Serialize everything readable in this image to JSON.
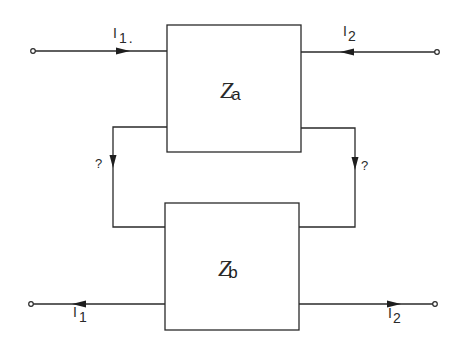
{
  "diagram": {
    "type": "two-port network interconnection",
    "blocks": {
      "top": {
        "symbol": "Z",
        "subscript": "a"
      },
      "bottom": {
        "symbol": "Z",
        "subscript": "b"
      }
    },
    "currents": {
      "top_left": {
        "symbol": "I",
        "subscript": "1",
        "trailing": ".",
        "direction": "right"
      },
      "top_right": {
        "symbol": "I",
        "subscript": "2",
        "direction": "left"
      },
      "bottom_left": {
        "symbol": "I",
        "subscript": "1",
        "direction": "left"
      },
      "bottom_right": {
        "symbol": "I",
        "subscript": "2",
        "direction": "right"
      }
    },
    "interconnects": {
      "left": {
        "label": "?",
        "direction": "down"
      },
      "right": {
        "label": "?",
        "direction": "down"
      }
    },
    "colors": {
      "line": "#2a2a2a",
      "background": "#ffffff"
    }
  }
}
